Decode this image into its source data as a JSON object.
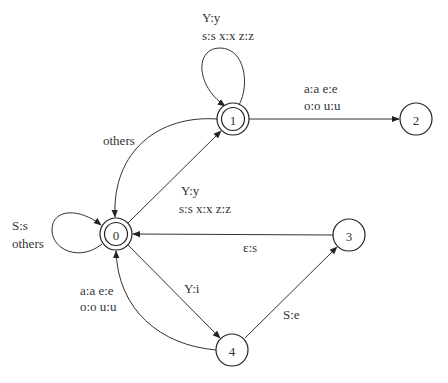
{
  "diagram": {
    "type": "finite-state-transducer",
    "states": [
      {
        "id": "0",
        "label": "0",
        "final": true,
        "x": 116,
        "y": 234
      },
      {
        "id": "1",
        "label": "1",
        "final": true,
        "x": 233,
        "y": 119
      },
      {
        "id": "2",
        "label": "2",
        "final": false,
        "x": 416,
        "y": 119
      },
      {
        "id": "3",
        "label": "3",
        "final": false,
        "x": 349,
        "y": 235
      },
      {
        "id": "4",
        "label": "4",
        "final": false,
        "x": 232,
        "y": 350
      }
    ],
    "transitions": [
      {
        "from": "1",
        "to": "1",
        "label_line1": "Y:y",
        "label_line2": "s:s x:x z:z"
      },
      {
        "from": "1",
        "to": "2",
        "label_line1": "a:a e:e",
        "label_line2": "o:o u:u"
      },
      {
        "from": "1",
        "to": "0",
        "label_line1": "others"
      },
      {
        "from": "0",
        "to": "1",
        "label_line1": "Y:y",
        "label_line2": "s:s x:x z:z"
      },
      {
        "from": "0",
        "to": "0",
        "label_line1": "S:s",
        "label_line2": "others"
      },
      {
        "from": "3",
        "to": "0",
        "label_line1": "ε:s"
      },
      {
        "from": "0",
        "to": "4",
        "label_line1": "Y:i"
      },
      {
        "from": "4",
        "to": "0",
        "label_line1": "a:a e:e",
        "label_line2": "o:o u:u"
      },
      {
        "from": "4",
        "to": "3",
        "label_line1": "S:e"
      }
    ]
  }
}
